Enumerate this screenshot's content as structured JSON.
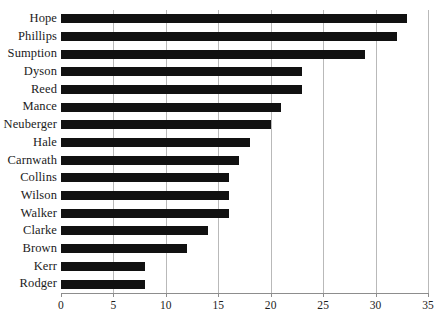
{
  "chart_data": {
    "type": "bar",
    "orientation": "horizontal",
    "title": "",
    "subtitle": "",
    "xlabel": "",
    "ylabel": "",
    "categories": [
      "Hope",
      "Phillips",
      "Sumption",
      "Dyson",
      "Reed",
      "Mance",
      "Neuberger",
      "Hale",
      "Carnwath",
      "Collins",
      "Wilson",
      "Walker",
      "Clarke",
      "Brown",
      "Kerr",
      "Rodger"
    ],
    "values": [
      33,
      32,
      29,
      23,
      23,
      21,
      20,
      18,
      17,
      16,
      16,
      16,
      14,
      12,
      8,
      8
    ],
    "xlim": [
      0,
      35
    ],
    "xticks": [
      0,
      5,
      10,
      15,
      20,
      25,
      30,
      35
    ],
    "xtick_labels": [
      "0",
      "5",
      "10",
      "15",
      "20",
      "25",
      "30",
      "35"
    ],
    "grid": "vertical",
    "legend": null,
    "bar_color": "#111111",
    "gridline_color": "#b9b9b9",
    "axis_color": "#8d8d8d",
    "background_color": "#ffffff"
  }
}
